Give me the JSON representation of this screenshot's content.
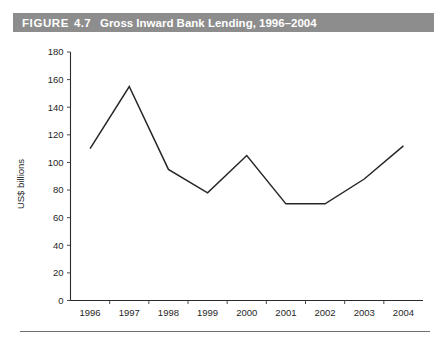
{
  "figure": {
    "label": "FIGURE",
    "number": "4.7",
    "title": "Gross Inward Bank Lending, 1996–2004",
    "header_bg": "#8d8d8d",
    "header_text_color": "#ffffff"
  },
  "chart_data": {
    "type": "line",
    "title": "Gross Inward Bank Lending, 1996–2004",
    "xlabel": "",
    "ylabel": "US$ billions",
    "categories": [
      "1996",
      "1997",
      "1998",
      "1999",
      "2000",
      "2001",
      "2002",
      "2003",
      "2004"
    ],
    "values": [
      110,
      155,
      95,
      78,
      105,
      70,
      70,
      88,
      112
    ],
    "series": [
      {
        "name": "Gross Inward Bank Lending",
        "values": [
          110,
          155,
          95,
          78,
          105,
          70,
          70,
          88,
          112
        ]
      }
    ],
    "ylim": [
      0,
      180
    ],
    "ytick_labels": [
      "0",
      "20",
      "40",
      "60",
      "80",
      "100",
      "120",
      "140",
      "160",
      "180"
    ],
    "ytick_values": [
      0,
      20,
      40,
      60,
      80,
      100,
      120,
      140,
      160,
      180
    ],
    "xtick_labels": [
      "1996",
      "1997",
      "1998",
      "1999",
      "2000",
      "2001",
      "2002",
      "2003",
      "2004"
    ],
    "grid": false,
    "legend": "none",
    "line_color": "#262626",
    "axis_color": "#2b2b2b",
    "background": "#ffffff"
  }
}
